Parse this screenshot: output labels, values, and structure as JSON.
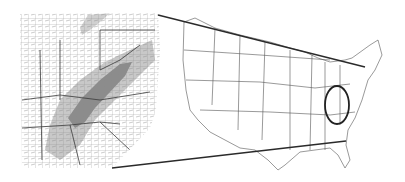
{
  "figure": {
    "colors": {
      "background": "#ffffff",
      "county_lines": "#8a8a8a",
      "state_lines": "#3a3a3a",
      "light_shade": "#c8c8c8",
      "dark_shade": "#8c8c8c",
      "lake": "#d0d0d0",
      "connector": "#2a2a2a",
      "circle": "#222222"
    },
    "inset": {
      "x": 20,
      "y": 12,
      "width": 140,
      "height": 156
    },
    "circle": {
      "cx": 337,
      "cy": 105,
      "rx": 12,
      "ry": 19
    },
    "connectors": [
      {
        "from": [
          158,
          15
        ],
        "to": [
          365,
          67
        ]
      },
      {
        "from": [
          112,
          168
        ],
        "to": [
          346,
          141
        ]
      }
    ]
  }
}
